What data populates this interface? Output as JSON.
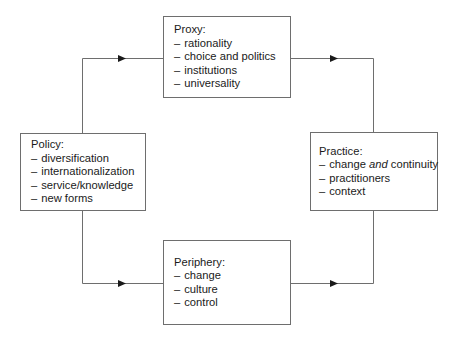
{
  "diagram": {
    "type": "cycle-flow",
    "nodes": [
      {
        "id": "proxy",
        "title": "Proxy:",
        "items": [
          "rationality",
          "choice and politics",
          "institutions",
          "universality"
        ]
      },
      {
        "id": "policy",
        "title": "Policy:",
        "items": [
          "diversification",
          "internationalization",
          "service/knowledge",
          "new forms"
        ]
      },
      {
        "id": "practice",
        "title": "Practice:",
        "items": [
          {
            "parts": [
              {
                "text": "change "
              },
              {
                "text": "and",
                "italic": true
              },
              {
                "text": " continuity"
              }
            ]
          },
          "practitioners",
          "context"
        ]
      },
      {
        "id": "periphery",
        "title": "Periphery:",
        "items": [
          "change",
          "culture",
          "control"
        ]
      }
    ],
    "edges": [
      {
        "from": "policy",
        "to": "proxy",
        "arrow": "right"
      },
      {
        "from": "proxy",
        "to": "practice",
        "arrow": "right"
      },
      {
        "from": "policy",
        "to": "periphery",
        "arrow": "right"
      },
      {
        "from": "periphery",
        "to": "practice",
        "arrow": "right"
      }
    ],
    "dash": "–",
    "colors": {
      "line": "#6e6e6e",
      "arrow": "#1a1a1a",
      "text": "#1a1a1a",
      "background": "#ffffff"
    }
  },
  "proxy": {
    "title": "Proxy:",
    "item_0": "rationality",
    "item_1": "choice and politics",
    "item_2": "institutions",
    "item_3": "universality"
  },
  "policy": {
    "title": "Policy:",
    "item_0": "diversification",
    "item_1": "internationalization",
    "item_2": "service/knowledge",
    "item_3": "new forms"
  },
  "practice": {
    "title": "Practice:",
    "item_0_pre": "change ",
    "item_0_em": "and",
    "item_0_post": " continuity",
    "item_1": "practitioners",
    "item_2": "context"
  },
  "periphery": {
    "title": "Periphery:",
    "item_0": "change",
    "item_1": "culture",
    "item_2": "control"
  },
  "dash": "–"
}
